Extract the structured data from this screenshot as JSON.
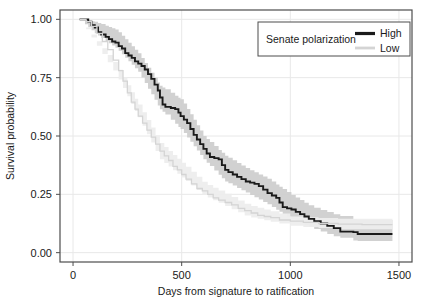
{
  "chart_data": {
    "type": "line",
    "title": "",
    "subtitle": "",
    "xlabel": "Days from signature to ratification",
    "ylabel": "Survival probability",
    "xlim": [
      -60,
      1560
    ],
    "ylim": [
      -0.04,
      1.04
    ],
    "xticks": [
      0,
      500,
      1000,
      1500
    ],
    "xticklabels": [
      "0",
      "500",
      "1000",
      "1500"
    ],
    "yticks": [
      0.0,
      0.25,
      0.5,
      0.75,
      1.0
    ],
    "yticklabels": [
      "0.00",
      "0.25",
      "0.50",
      "0.75",
      "1.00"
    ],
    "grid": true,
    "grid_color": "#e8e8e8",
    "panel_background": "#ffffff",
    "border_color": "#4d4d4d",
    "legend": {
      "title": "Senate polarization",
      "position": "top-right",
      "entries": [
        {
          "label": "High",
          "color": "#1a1a1a",
          "linewidth": 3
        },
        {
          "label": "Low",
          "color": "#d4d4d4",
          "linewidth": 2.4
        }
      ]
    },
    "series": [
      {
        "name": "High",
        "color": "#1a1a1a",
        "band_color": "#cfcfcf",
        "step": "hv",
        "points": [
          [
            30,
            1.0
          ],
          [
            55,
            1.0
          ],
          [
            70,
            0.99
          ],
          [
            85,
            0.975
          ],
          [
            100,
            0.965
          ],
          [
            115,
            0.945
          ],
          [
            130,
            0.935
          ],
          [
            150,
            0.925
          ],
          [
            165,
            0.915
          ],
          [
            180,
            0.905
          ],
          [
            195,
            0.9
          ],
          [
            210,
            0.885
          ],
          [
            225,
            0.875
          ],
          [
            240,
            0.855
          ],
          [
            255,
            0.845
          ],
          [
            270,
            0.835
          ],
          [
            285,
            0.82
          ],
          [
            300,
            0.81
          ],
          [
            315,
            0.8
          ],
          [
            330,
            0.785
          ],
          [
            345,
            0.765
          ],
          [
            360,
            0.745
          ],
          [
            375,
            0.72
          ],
          [
            390,
            0.695
          ],
          [
            400,
            0.665
          ],
          [
            412,
            0.635
          ],
          [
            425,
            0.625
          ],
          [
            450,
            0.62
          ],
          [
            470,
            0.615
          ],
          [
            485,
            0.6
          ],
          [
            495,
            0.585
          ],
          [
            510,
            0.57
          ],
          [
            525,
            0.555
          ],
          [
            540,
            0.53
          ],
          [
            555,
            0.505
          ],
          [
            570,
            0.485
          ],
          [
            585,
            0.465
          ],
          [
            600,
            0.445
          ],
          [
            615,
            0.425
          ],
          [
            630,
            0.41
          ],
          [
            650,
            0.405
          ],
          [
            670,
            0.4
          ],
          [
            685,
            0.375
          ],
          [
            700,
            0.355
          ],
          [
            715,
            0.345
          ],
          [
            735,
            0.335
          ],
          [
            755,
            0.325
          ],
          [
            775,
            0.315
          ],
          [
            795,
            0.305
          ],
          [
            815,
            0.3
          ],
          [
            835,
            0.295
          ],
          [
            855,
            0.285
          ],
          [
            875,
            0.27
          ],
          [
            895,
            0.255
          ],
          [
            915,
            0.245
          ],
          [
            935,
            0.235
          ],
          [
            950,
            0.215
          ],
          [
            965,
            0.195
          ],
          [
            985,
            0.19
          ],
          [
            1005,
            0.185
          ],
          [
            1025,
            0.175
          ],
          [
            1045,
            0.165
          ],
          [
            1065,
            0.155
          ],
          [
            1085,
            0.145
          ],
          [
            1110,
            0.135
          ],
          [
            1140,
            0.125
          ],
          [
            1170,
            0.115
          ],
          [
            1200,
            0.105
          ],
          [
            1230,
            0.09
          ],
          [
            1290,
            0.088
          ],
          [
            1310,
            0.08
          ],
          [
            1400,
            0.08
          ],
          [
            1470,
            0.08
          ]
        ],
        "band_lower": [
          [
            30,
            1.0
          ],
          [
            100,
            0.94
          ],
          [
            200,
            0.875
          ],
          [
            300,
            0.775
          ],
          [
            400,
            0.615
          ],
          [
            500,
            0.525
          ],
          [
            600,
            0.4
          ],
          [
            700,
            0.305
          ],
          [
            800,
            0.255
          ],
          [
            900,
            0.205
          ],
          [
            1000,
            0.145
          ],
          [
            1100,
            0.105
          ],
          [
            1200,
            0.07
          ],
          [
            1300,
            0.05
          ],
          [
            1470,
            0.05
          ]
        ],
        "band_upper": [
          [
            30,
            1.0
          ],
          [
            100,
            0.99
          ],
          [
            200,
            0.955
          ],
          [
            300,
            0.855
          ],
          [
            400,
            0.715
          ],
          [
            500,
            0.655
          ],
          [
            600,
            0.5
          ],
          [
            700,
            0.415
          ],
          [
            800,
            0.36
          ],
          [
            900,
            0.315
          ],
          [
            1000,
            0.25
          ],
          [
            1100,
            0.195
          ],
          [
            1200,
            0.165
          ],
          [
            1300,
            0.14
          ],
          [
            1470,
            0.14
          ]
        ]
      },
      {
        "name": "Low",
        "color": "#d4d4d4",
        "band_color": "#ededed",
        "step": "hv",
        "points": [
          [
            30,
            1.0
          ],
          [
            60,
            0.99
          ],
          [
            85,
            0.97
          ],
          [
            110,
            0.94
          ],
          [
            135,
            0.905
          ],
          [
            160,
            0.87
          ],
          [
            185,
            0.825
          ],
          [
            210,
            0.78
          ],
          [
            230,
            0.735
          ],
          [
            250,
            0.685
          ],
          [
            268,
            0.645
          ],
          [
            285,
            0.615
          ],
          [
            300,
            0.585
          ],
          [
            320,
            0.555
          ],
          [
            340,
            0.525
          ],
          [
            360,
            0.495
          ],
          [
            380,
            0.465
          ],
          [
            400,
            0.435
          ],
          [
            420,
            0.415
          ],
          [
            440,
            0.395
          ],
          [
            460,
            0.37
          ],
          [
            480,
            0.355
          ],
          [
            500,
            0.335
          ],
          [
            520,
            0.315
          ],
          [
            545,
            0.295
          ],
          [
            570,
            0.275
          ],
          [
            595,
            0.265
          ],
          [
            620,
            0.25
          ],
          [
            645,
            0.235
          ],
          [
            670,
            0.225
          ],
          [
            700,
            0.215
          ],
          [
            730,
            0.205
          ],
          [
            760,
            0.19
          ],
          [
            790,
            0.18
          ],
          [
            820,
            0.17
          ],
          [
            850,
            0.16
          ],
          [
            880,
            0.155
          ],
          [
            910,
            0.15
          ],
          [
            950,
            0.14
          ],
          [
            1000,
            0.135
          ],
          [
            1060,
            0.13
          ],
          [
            1130,
            0.125
          ],
          [
            1220,
            0.122
          ],
          [
            1330,
            0.12
          ],
          [
            1470,
            0.12
          ]
        ],
        "band_lower": [
          [
            30,
            1.0
          ],
          [
            200,
            0.76
          ],
          [
            400,
            0.4
          ],
          [
            600,
            0.245
          ],
          [
            800,
            0.155
          ],
          [
            1000,
            0.115
          ],
          [
            1200,
            0.1
          ],
          [
            1470,
            0.1
          ]
        ],
        "band_upper": [
          [
            30,
            1.0
          ],
          [
            200,
            0.8
          ],
          [
            400,
            0.47
          ],
          [
            600,
            0.3
          ],
          [
            800,
            0.205
          ],
          [
            1000,
            0.155
          ],
          [
            1200,
            0.145
          ],
          [
            1470,
            0.145
          ]
        ]
      }
    ]
  },
  "axes": {
    "x_title": "Days from signature to ratification",
    "y_title": "Survival probability"
  },
  "legend": {
    "title": "Senate polarization",
    "item_high": "High",
    "item_low": "Low"
  },
  "ticks": {
    "x": [
      "0",
      "500",
      "1000",
      "1500"
    ],
    "y": [
      "0.00",
      "0.25",
      "0.50",
      "0.75",
      "1.00"
    ]
  }
}
